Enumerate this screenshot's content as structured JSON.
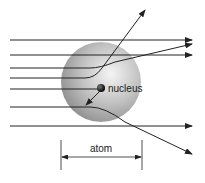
{
  "diagram": {
    "labels": {
      "nucleus": "nucleus",
      "atom": "atom"
    },
    "colors": {
      "line": "#222222",
      "atom_light": "#f2f2f2",
      "atom_mid": "#bdbdbd",
      "atom_dark": "#8a8a8a",
      "nucleus": "#111111"
    },
    "elements": [
      {
        "type": "atom-sphere",
        "cx": 100,
        "cy": 80,
        "r": 40
      },
      {
        "type": "nucleus",
        "cx": 101,
        "cy": 88,
        "r": 4
      },
      {
        "type": "trajectory",
        "desc": "straight through, top"
      },
      {
        "type": "trajectory",
        "desc": "straight through, second"
      },
      {
        "type": "trajectory",
        "desc": "deflected slightly upward"
      },
      {
        "type": "trajectory",
        "desc": "deflected sharply upward"
      },
      {
        "type": "trajectory",
        "desc": "back-scattered from nucleus"
      },
      {
        "type": "trajectory",
        "desc": "deflected downward"
      },
      {
        "type": "trajectory",
        "desc": "straight through, bottom"
      },
      {
        "type": "dimension",
        "desc": "atom diameter"
      }
    ]
  }
}
